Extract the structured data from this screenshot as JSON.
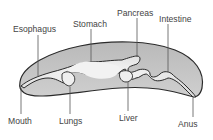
{
  "diagram": {
    "labels": {
      "esophagus": "Esophagus",
      "stomach": "Stomach",
      "pancreas": "Pancreas",
      "intestine": "Intestine",
      "mouth": "Mouth",
      "lungs": "Lungs",
      "liver": "Liver",
      "anus": "Anus"
    },
    "colors": {
      "body_fill": "#c4c4c4",
      "tract_fill": "#ececec",
      "outline": "#2a2a2a",
      "leader_line": "#555555",
      "text": "#444444"
    }
  }
}
